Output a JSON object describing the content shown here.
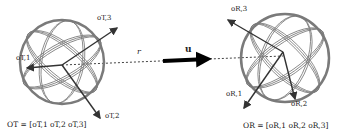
{
  "diagram": {
    "left_object": {
      "axis_labels": [
        "o_{T,1}",
        "o_{T,2}",
        "o_{T,3}"
      ],
      "axis_labels_display": [
        "oT,1",
        "oT,2",
        "oT,3"
      ],
      "equation": "O_T = [o_{T,1} o_{T,2} o_{T,3}]",
      "equation_display": "OT = [oT,1 oT,2 oT,3]"
    },
    "right_object": {
      "axis_labels": [
        "o_{R,1}",
        "o_{R,2}",
        "o_{R,3}"
      ],
      "axis_labels_display": [
        "oR,1",
        "oR,2",
        "oR,3"
      ],
      "equation": "O_R = [o_{R,1} o_{R,2} o_{R,3}]",
      "equation_display": "OR = [oR,1 oR,2 oR,3]"
    },
    "vectors": {
      "r_label": "r",
      "u_label": "u"
    },
    "colors": {
      "sphere_gray": "#7a7a7a",
      "axis_dark": "#333333",
      "arrow_black": "#000000"
    }
  }
}
